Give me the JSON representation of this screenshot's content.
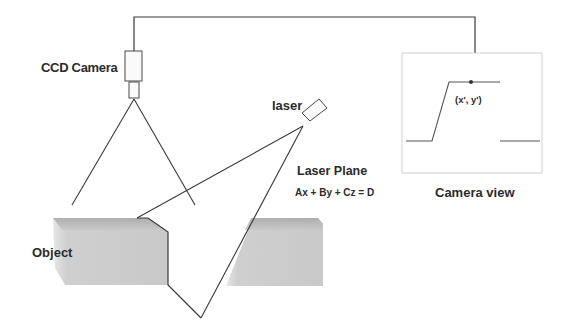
{
  "diagram": {
    "labels": {
      "ccd_camera": "CCD Camera",
      "laser": "laser",
      "laser_plane": "Laser Plane",
      "plane_equation": "Ax + By + Cz = D",
      "camera_view": "Camera view",
      "object": "Object",
      "image_point": "(x', y')"
    },
    "colors": {
      "line": "#3a3a3a",
      "object_fill": "#c8c8c8",
      "object_top": "#a8a8a8",
      "view_border": "#cfcfcf"
    }
  }
}
